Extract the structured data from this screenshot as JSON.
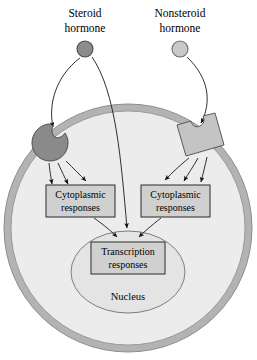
{
  "figure": {
    "type": "cell-signaling-diagram"
  },
  "hormones": [
    {
      "id": "steroid",
      "label_line1": "Steroid",
      "label_line2": "hormone",
      "marker": "filled-circle",
      "color": "#8c8c8c",
      "stroke": "#4a4a4a",
      "x": 85,
      "y": 49,
      "radius": 8
    },
    {
      "id": "nonsteroid",
      "label_line1": "Nonsteroid",
      "label_line2": "hormone",
      "marker": "light-circle",
      "color": "#c9c9c9",
      "stroke": "#6d6d6d",
      "x": 180,
      "y": 49,
      "radius": 8
    }
  ],
  "cell": {
    "membrane_color": "#b3b3b3",
    "membrane_stroke": "#8a8a8a",
    "cytoplasm_color": "#ececec",
    "cytoplasm_stroke": "#9a9a9a"
  },
  "receptors": [
    {
      "id": "intracellular-receptor",
      "name": "steroid-receptor",
      "fill": "#8a8a8a",
      "stroke": "#4f4f4f"
    },
    {
      "id": "membrane-receptor",
      "name": "nonsteroid-receptor",
      "fill": "#c4c4c4",
      "stroke": "#5a5a5a"
    }
  ],
  "nucleus": {
    "label": "Nucleus",
    "fill": "#e4e4e4",
    "stroke": "#7d7d7d"
  },
  "response_boxes": [
    {
      "id": "cytoplasmic-left",
      "line1": "Cytoplasmic",
      "line2": "responses",
      "side": "left"
    },
    {
      "id": "cytoplasmic-right",
      "line1": "Cytoplasmic",
      "line2": "responses",
      "side": "right"
    },
    {
      "id": "transcription",
      "line1": "Transcription",
      "line2": "responses",
      "side": "center"
    }
  ],
  "colors": {
    "line": "#1a1a1a",
    "box_fill": "#d0d0d0",
    "box_stroke": "#3a3a3a",
    "text": "#000000"
  }
}
